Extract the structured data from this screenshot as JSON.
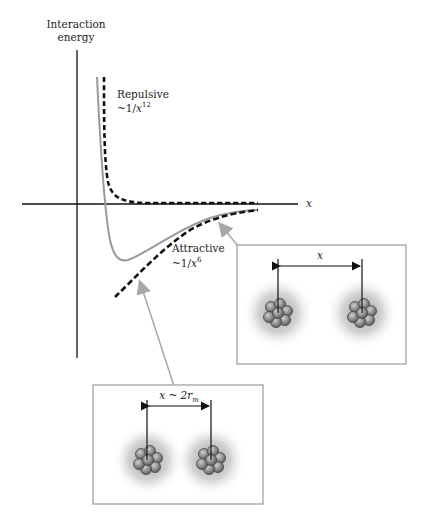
{
  "axes": {
    "y_label_line1": "Interaction",
    "y_label_line2": "energy",
    "x_label": "x"
  },
  "curves": {
    "repulsive": {
      "label": "Repulsive",
      "formula_prefix": "~1/",
      "formula_var": "x",
      "formula_exp": "12"
    },
    "attractive": {
      "label": "Attractive",
      "formula_prefix": "~1/",
      "formula_var": "x",
      "formula_exp": "6"
    },
    "total": {
      "label": "Lennard-Jones potential"
    }
  },
  "insets": {
    "far": {
      "distance_label": "x"
    },
    "equilibrium": {
      "distance_label_prefix": "x ~ 2",
      "distance_label_var": "r",
      "distance_label_sub": "m"
    }
  },
  "colors": {
    "axis": "#111111",
    "potential": "#9a9a9a",
    "dashed": "#111111",
    "box": "#9a9a9a",
    "arrow": "#a8a8a8"
  }
}
